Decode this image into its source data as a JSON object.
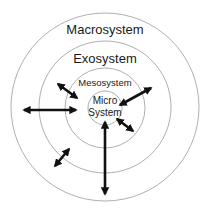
{
  "diagram": {
    "colors": {
      "background": "#ffffff",
      "ring_stroke": "#9a9a9a",
      "text": "#1a1a1a",
      "arrow": "#111111"
    },
    "rings": [
      {
        "id": "macrosystem",
        "label": "Macrosystem",
        "cx": 105,
        "cy": 107,
        "r": 94
      },
      {
        "id": "exosystem",
        "label": "Exosystem",
        "cx": 105,
        "cy": 107,
        "r": 66
      },
      {
        "id": "mesosystem",
        "label": "Mesosystem",
        "cx": 105,
        "cy": 108,
        "r": 40
      },
      {
        "id": "microsystem",
        "label_line1": "Micro",
        "label_line2": "System",
        "cx": 105,
        "cy": 108,
        "r": 17
      }
    ],
    "labels": {
      "macrosystem": "Macrosystem",
      "exosystem": "Exosystem",
      "mesosystem": "Mesosystem",
      "micro_line1": "Micro",
      "micro_line2": "System"
    },
    "arrows": [
      {
        "id": "upper-left-diagonal",
        "type": "double-headed",
        "x1": 58,
        "y1": 84,
        "x2": 77,
        "y2": 98
      },
      {
        "id": "upper-right-diagonal",
        "type": "double-headed",
        "x1": 120,
        "y1": 105,
        "x2": 151,
        "y2": 88
      },
      {
        "id": "left-horizontal",
        "type": "double-headed",
        "x1": 24,
        "y1": 110,
        "x2": 76,
        "y2": 110
      },
      {
        "id": "lower-right-diagonal",
        "type": "double-headed",
        "x1": 117,
        "y1": 119,
        "x2": 133,
        "y2": 131
      },
      {
        "id": "lower-left-diagonal",
        "type": "double-headed",
        "x1": 55,
        "y1": 166,
        "x2": 69,
        "y2": 149
      },
      {
        "id": "bottom-vertical",
        "type": "double-headed",
        "x1": 105,
        "y1": 122,
        "x2": 105,
        "y2": 194
      }
    ]
  }
}
